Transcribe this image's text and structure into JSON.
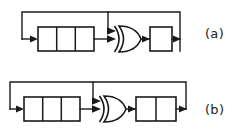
{
  "figure": {
    "type": "logic-diagram",
    "background_color": "#ffffff",
    "line_color": "#1a1a1a",
    "panels": [
      {
        "id": "a",
        "label": "(a)",
        "label_x": 205,
        "label_y": 38,
        "register_left": {
          "name": "shift-register-left",
          "cells": 3,
          "x": 38,
          "y": 27,
          "width": 56,
          "height": 24
        },
        "gate": {
          "name": "xor-gate",
          "type": "XOR",
          "inputs": 2,
          "x": 115,
          "y": 26,
          "width": 26,
          "height": 26
        },
        "register_right": {
          "name": "shift-register-right",
          "cells": 1,
          "x": 150,
          "y": 27,
          "width": 22,
          "height": 24
        },
        "feedback_top_y": 12,
        "feedback_left_x": 22,
        "tap_x": 108,
        "feedback_right_x": 180
      },
      {
        "id": "b",
        "label": "(b)",
        "label_x": 205,
        "label_y": 108,
        "register_left": {
          "name": "shift-register-left",
          "cells": 3,
          "x": 24,
          "y": 97,
          "width": 56,
          "height": 24
        },
        "gate": {
          "name": "xor-gate",
          "type": "XOR",
          "inputs": 2,
          "x": 100,
          "y": 96,
          "width": 26,
          "height": 26
        },
        "register_right": {
          "name": "shift-register-right",
          "cells": 2,
          "x": 136,
          "y": 97,
          "width": 40,
          "height": 24
        },
        "feedback_top_y": 82,
        "feedback_left_x": 10,
        "tap_x": 93,
        "feedback_right_x": 186
      }
    ]
  }
}
